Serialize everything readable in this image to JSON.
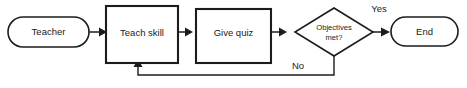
{
  "diagram": {
    "type": "flowchart",
    "background_color": "#ffffff",
    "line_color": "#1c1c1c",
    "fill_color": "#ffffff",
    "nodes": [
      {
        "id": "teacher",
        "shape": "terminator",
        "label": "Teacher"
      },
      {
        "id": "teach",
        "shape": "process",
        "label": "Teach skill"
      },
      {
        "id": "quiz",
        "shape": "process",
        "label": "Give quiz"
      },
      {
        "id": "objectives",
        "shape": "decision",
        "label_line1": "Objectives",
        "label_line2": "met?"
      },
      {
        "id": "end",
        "shape": "terminator",
        "label": "End"
      }
    ],
    "edges": [
      {
        "id": "e1",
        "from": "teacher",
        "to": "teach",
        "label": ""
      },
      {
        "id": "e2",
        "from": "teach",
        "to": "quiz",
        "label": ""
      },
      {
        "id": "e3",
        "from": "quiz",
        "to": "objectives",
        "label": ""
      },
      {
        "id": "e4",
        "from": "objectives",
        "to": "end",
        "label": "Yes"
      },
      {
        "id": "e5",
        "from": "objectives",
        "to": "teach",
        "label": "No"
      }
    ]
  }
}
